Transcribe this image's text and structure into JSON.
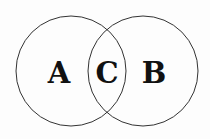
{
  "diagram": {
    "type": "venn",
    "sets": [
      {
        "label": "A",
        "cx": 71,
        "cy": 71,
        "r": 55
      },
      {
        "label": "B",
        "cx": 143,
        "cy": 71,
        "r": 55
      }
    ],
    "intersection_label": "C",
    "stroke_color": "#333333",
    "text_color": "#111111"
  }
}
